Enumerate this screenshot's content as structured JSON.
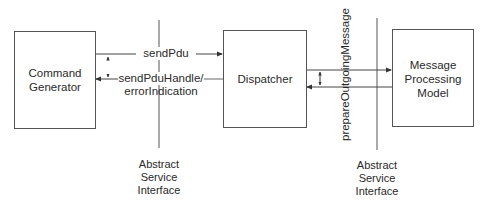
{
  "boxes": {
    "command_generator": {
      "line1": "Command",
      "line2": "Generator"
    },
    "dispatcher": {
      "label": "Dispatcher"
    },
    "message_processing_model": {
      "line1": "Message",
      "line2": "Processing",
      "line3": "Model"
    }
  },
  "arrows": {
    "send_pdu": "sendPdu",
    "send_pdu_handle_line1": "sendPduHandle/",
    "send_pdu_handle_line2": "errorIndication",
    "prepare_outgoing_message": "prepareOutgoingMessage"
  },
  "interfaces": {
    "left": {
      "line1": "Abstract",
      "line2": "Service",
      "line3": "Interface"
    },
    "right": {
      "line1": "Abstract",
      "line2": "Service",
      "line3": "Interface"
    }
  },
  "colors": {
    "line": "#444444",
    "text": "#2a2a2a",
    "background": "#ffffff"
  }
}
